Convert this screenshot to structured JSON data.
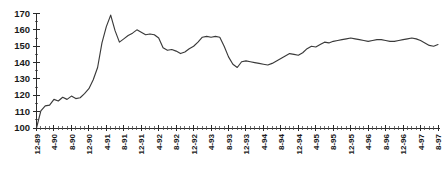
{
  "chart_data": {
    "type": "line",
    "title": "",
    "subtitle": "",
    "xlabel": "",
    "ylabel": "",
    "ylim": [
      100,
      170
    ],
    "ytick_values": [
      100,
      110,
      120,
      130,
      140,
      150,
      160,
      170
    ],
    "ytick_labels": [
      "100",
      "110",
      "120",
      "130",
      "140",
      "150",
      "160",
      "170"
    ],
    "grid": false,
    "legend": false,
    "legend_position": "none",
    "annotations": [],
    "x_tick_interval_months": 4,
    "x_labeled_ticks": [
      "12-89",
      "4-90",
      "8-90",
      "12-90",
      "4-91",
      "8-91",
      "12-91",
      "4-92",
      "8-92",
      "12-92",
      "4-93",
      "8-93",
      "12-93",
      "4-94",
      "8-94",
      "12-94",
      "4-95",
      "8-95",
      "12-95",
      "4-96",
      "8-96",
      "12-96",
      "4-97",
      "8-97"
    ],
    "x": [
      "12-89",
      "1-90",
      "2-90",
      "3-90",
      "4-90",
      "5-90",
      "6-90",
      "7-90",
      "8-90",
      "9-90",
      "10-90",
      "11-90",
      "12-90",
      "1-91",
      "2-91",
      "3-91",
      "4-91",
      "5-91",
      "6-91",
      "7-91",
      "8-91",
      "9-91",
      "10-91",
      "11-91",
      "12-91",
      "1-92",
      "2-92",
      "3-92",
      "4-92",
      "5-92",
      "6-92",
      "7-92",
      "8-92",
      "9-92",
      "10-92",
      "11-92",
      "12-92",
      "1-93",
      "2-93",
      "3-93",
      "4-93",
      "5-93",
      "6-93",
      "7-93",
      "8-93",
      "9-93",
      "10-93",
      "11-93",
      "12-93",
      "1-94",
      "2-94",
      "3-94",
      "4-94",
      "5-94",
      "6-94",
      "7-94",
      "8-94",
      "9-94",
      "10-94",
      "11-94",
      "12-94",
      "1-95",
      "2-95",
      "3-95",
      "4-95",
      "5-95",
      "6-95",
      "7-95",
      "8-95",
      "9-95",
      "10-95",
      "11-95",
      "12-95",
      "1-96",
      "2-96",
      "3-96",
      "4-96",
      "5-96",
      "6-96",
      "7-96",
      "8-96",
      "9-96",
      "10-96",
      "11-96",
      "12-96",
      "1-97",
      "2-97",
      "3-97",
      "4-97",
      "5-97",
      "6-97",
      "7-97",
      "8-97"
    ],
    "values": [
      100.0,
      110.5,
      113.5,
      114.0,
      117.5,
      116.5,
      118.8,
      117.5,
      119.5,
      118.0,
      118.5,
      121.0,
      124.0,
      129.5,
      137.0,
      152.0,
      162.0,
      169.0,
      159.5,
      152.5,
      154.5,
      156.5,
      158.0,
      160.0,
      158.5,
      157.0,
      157.5,
      157.0,
      155.0,
      149.0,
      147.5,
      148.0,
      147.0,
      145.5,
      146.5,
      148.5,
      150.0,
      152.5,
      155.5,
      156.0,
      155.5,
      156.0,
      155.5,
      150.0,
      143.5,
      139.0,
      137.0,
      140.5,
      141.0,
      140.5,
      140.0,
      139.5,
      139.0,
      138.5,
      139.5,
      141.0,
      142.5,
      144.0,
      145.5,
      145.0,
      144.5,
      146.0,
      148.5,
      150.0,
      149.5,
      151.0,
      152.5,
      152.0,
      153.0,
      153.5,
      154.0,
      154.5,
      155.0,
      154.5,
      154.0,
      153.5,
      153.0,
      153.5,
      154.0,
      154.0,
      153.5,
      153.0,
      153.0,
      153.5,
      154.0,
      154.5,
      155.0,
      154.5,
      153.5,
      152.0,
      150.5,
      150.0,
      151.0
    ]
  }
}
